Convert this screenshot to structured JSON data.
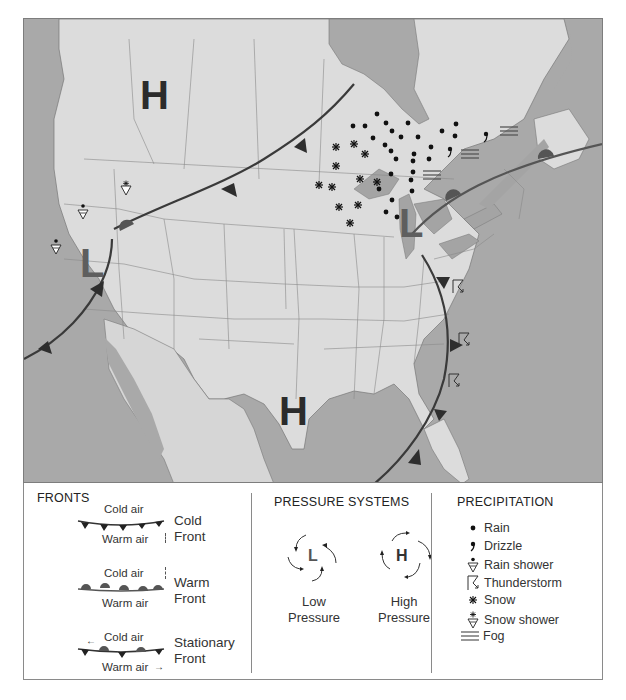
{
  "map": {
    "colors": {
      "water": "#a9a9a9",
      "land": "#dcdcdc",
      "lakes": "#a4a4a4",
      "front_line": "#3a3a3a",
      "warm_front_symbol": "#5a5a5a",
      "low_letter": "#5e5e5e",
      "high_letter": "#2b2b2b"
    },
    "pressure_labels": [
      {
        "type": "high",
        "text": "H",
        "location": "western Canada (Alberta)"
      },
      {
        "type": "low",
        "text": "L",
        "location": "Nevada / Oregon border"
      },
      {
        "type": "high",
        "text": "H",
        "location": "Oklahoma / Texas"
      },
      {
        "type": "low",
        "text": "L",
        "location": "Michigan"
      }
    ],
    "fronts": [
      {
        "type": "cold",
        "from": "Pacific off California",
        "to": "Nevada low",
        "label": "cold front west"
      },
      {
        "type": "cold",
        "from": "Idaho",
        "to": "Ontario",
        "label": "cold front north"
      },
      {
        "type": "warm",
        "from": "Michigan low",
        "to": "Quebec/Maritimes",
        "label": "warm front northeast"
      },
      {
        "type": "cold",
        "from": "Michigan low",
        "to": "Gulf of Mexico",
        "label": "cold front southeast"
      }
    ],
    "precipitation_symbols": [
      {
        "type": "rain-shower",
        "location": "Oregon"
      },
      {
        "type": "rain-shower",
        "location": "northern California"
      },
      {
        "type": "snow-shower",
        "location": "Idaho"
      },
      {
        "type": "snow",
        "location": "Minnesota / Wisconsin"
      },
      {
        "type": "rain",
        "location": "Ontario / Great Lakes"
      },
      {
        "type": "drizzle",
        "location": "Quebec"
      },
      {
        "type": "fog",
        "location": "Ontario / Quebec"
      },
      {
        "type": "thunderstorm",
        "location": "West Virginia / Carolinas / Georgia"
      }
    ]
  },
  "legend": {
    "fronts": {
      "title": "FRONTS",
      "items": [
        {
          "name_line1": "Cold",
          "name_line2": "Front",
          "top_label": "Cold air",
          "bottom_label": "Warm air"
        },
        {
          "name_line1": "Warm",
          "name_line2": "Front",
          "top_label": "Cold air",
          "bottom_label": "Warm air"
        },
        {
          "name_line1": "Stationary",
          "name_line2": "Front",
          "top_label": "Cold air",
          "bottom_label": "Warm air"
        }
      ]
    },
    "pressure": {
      "title": "PRESSURE SYSTEMS",
      "low": {
        "letter": "L",
        "line1": "Low",
        "line2": "Pressure"
      },
      "high": {
        "letter": "H",
        "line1": "High",
        "line2": "Pressure"
      }
    },
    "precipitation": {
      "title": "PRECIPITATION",
      "items": [
        {
          "icon": "rain-icon",
          "label": "Rain"
        },
        {
          "icon": "drizzle-icon",
          "label": "Drizzle"
        },
        {
          "icon": "rain-shower-icon",
          "label": "Rain shower"
        },
        {
          "icon": "thunderstorm-icon",
          "label": "Thunderstorm"
        },
        {
          "icon": "snow-icon",
          "label": "Snow"
        },
        {
          "icon": "snow-shower-icon",
          "label": "Snow shower"
        },
        {
          "icon": "fog-icon",
          "label": "Fog"
        }
      ]
    }
  }
}
